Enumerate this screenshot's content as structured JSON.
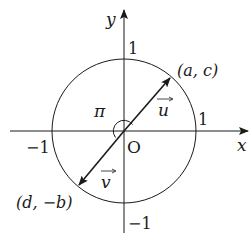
{
  "diagram": {
    "type": "unit-circle-vectors",
    "axes": {
      "x_label": "x",
      "y_label": "y",
      "origin_label": "O",
      "tick_x_pos": "1",
      "tick_x_neg": "−1",
      "tick_y_pos": "1",
      "tick_y_neg": "−1"
    },
    "angle_label": "π",
    "vectors": [
      {
        "name": "u",
        "label": "u",
        "endpoint_label": "(a, c)"
      },
      {
        "name": "v",
        "label": "v",
        "endpoint_label": "(d, −b)"
      }
    ],
    "colors": {
      "stroke": "#1a1a1a",
      "background": "#ffffff"
    }
  }
}
